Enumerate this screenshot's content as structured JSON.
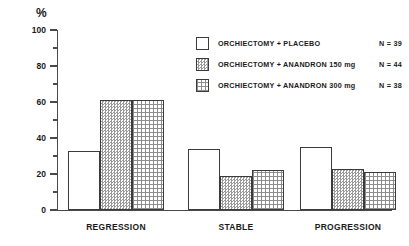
{
  "chart_data": {
    "type": "bar",
    "title": "",
    "xlabel": "",
    "ylabel": "%",
    "ylim": [
      0,
      100
    ],
    "ytick_labels": [
      "100",
      "80",
      "60",
      "40",
      "20",
      "0"
    ],
    "ytick_values": [
      100,
      80,
      60,
      40,
      20,
      0
    ],
    "minor_tick_values": [
      90,
      70,
      50,
      30,
      10
    ],
    "grid": false,
    "legend_position": "top-right",
    "categories": [
      "REGRESSION",
      "STABLE",
      "PROGRESSION"
    ],
    "series": [
      {
        "name": "ORCHIECTOMY + PLACEBO",
        "n_label": "N = 39",
        "n": 39,
        "fill": "plain",
        "values": [
          33,
          34,
          35
        ]
      },
      {
        "name": "ORCHIECTOMY + ANANDRON 150 mg",
        "n_label": "N = 44",
        "n": 44,
        "fill": "stipple",
        "values": [
          61,
          19,
          23
        ]
      },
      {
        "name": "ORCHIECTOMY + ANANDRON 300 mg",
        "n_label": "N = 38",
        "n": 38,
        "fill": "grid",
        "values": [
          61,
          22,
          21
        ]
      }
    ]
  },
  "axis": {
    "unit_label": "%"
  },
  "colors": {
    "axis": "#4a4a4a",
    "bar_outline": "#3b3b3b",
    "stipple": "#9a9a9a",
    "grid_pattern": "#8d8d8d",
    "background": "#ffffff"
  }
}
